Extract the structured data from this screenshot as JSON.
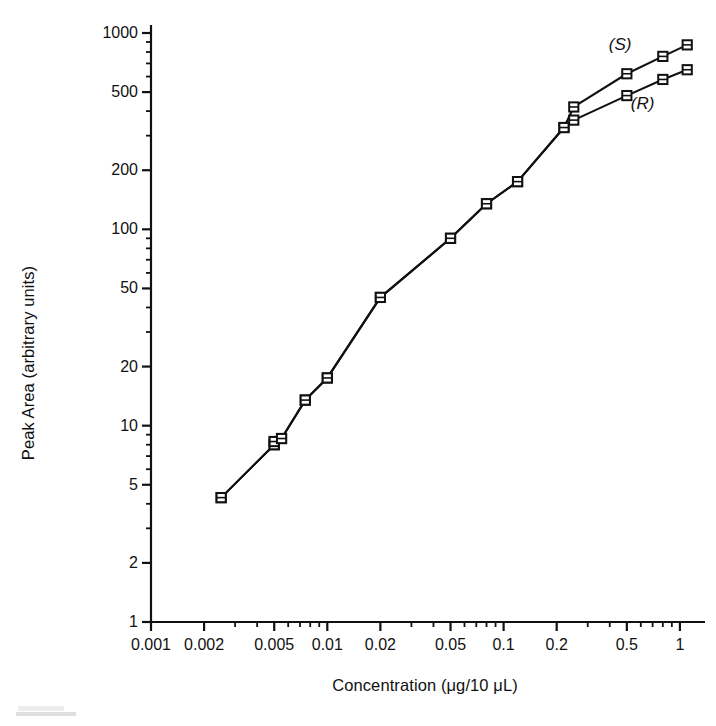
{
  "chart_data": {
    "type": "line",
    "title": "",
    "xlabel": "Concentration (μg/10 μL)",
    "ylabel": "Peak Area (arbitrary units)",
    "xscale": "log",
    "yscale": "log",
    "xlim": [
      0.001,
      1.3
    ],
    "ylim": [
      1,
      1000
    ],
    "grid": false,
    "legend_position": "inline-annotation",
    "xticks": [
      0.001,
      0.002,
      0.005,
      0.01,
      0.02,
      0.05,
      0.1,
      0.2,
      0.5,
      1
    ],
    "xtick_labels": [
      "0.001",
      "0.002",
      "0.005",
      "0.01",
      "0.02",
      "0.05",
      "0.1",
      "0.2",
      "0.5",
      "1"
    ],
    "yticks": [
      1,
      2,
      5,
      10,
      20,
      50,
      100,
      200,
      500,
      1000
    ],
    "ytick_labels": [
      "1",
      "2",
      "5",
      "10",
      "20",
      "50",
      "100",
      "200",
      "500",
      "1000"
    ],
    "marker": "open-square",
    "line_color": "#111111",
    "series": [
      {
        "name": "(S)",
        "label": "(S)",
        "x": [
          0.0025,
          0.005,
          0.005,
          0.0055,
          0.0075,
          0.01,
          0.02,
          0.05,
          0.08,
          0.12,
          0.22,
          0.25,
          0.5,
          0.8,
          1.1
        ],
        "y": [
          4.3,
          8.0,
          8.3,
          8.6,
          13.5,
          17.5,
          45,
          90,
          135,
          175,
          330,
          420,
          620,
          760,
          870
        ]
      },
      {
        "name": "(R)",
        "label": "(R)",
        "x": [
          0.0025,
          0.005,
          0.005,
          0.0055,
          0.0075,
          0.01,
          0.02,
          0.05,
          0.08,
          0.12,
          0.22,
          0.25,
          0.5,
          0.8,
          1.1
        ],
        "y": [
          4.3,
          8.0,
          8.3,
          8.6,
          13.5,
          17.5,
          45,
          90,
          135,
          175,
          330,
          360,
          480,
          580,
          650
        ]
      }
    ],
    "annotations": [
      {
        "text": "(S)",
        "series": "(S)",
        "x": 0.45,
        "y": 860
      },
      {
        "text": "(R)",
        "series": "(R)",
        "x": 0.6,
        "y": 430
      }
    ]
  },
  "axis": {
    "x_title": "Concentration (μg/10 μL)",
    "y_title": "Peak Area (arbitrary units)"
  }
}
